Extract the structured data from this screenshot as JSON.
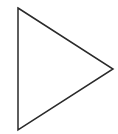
{
  "shape": {
    "type": "triangle",
    "points": "18,8 113,69 18,130",
    "stroke": "#2a2a2a",
    "fill": "none",
    "stroke_width": 1.5
  },
  "background": "#ffffff"
}
